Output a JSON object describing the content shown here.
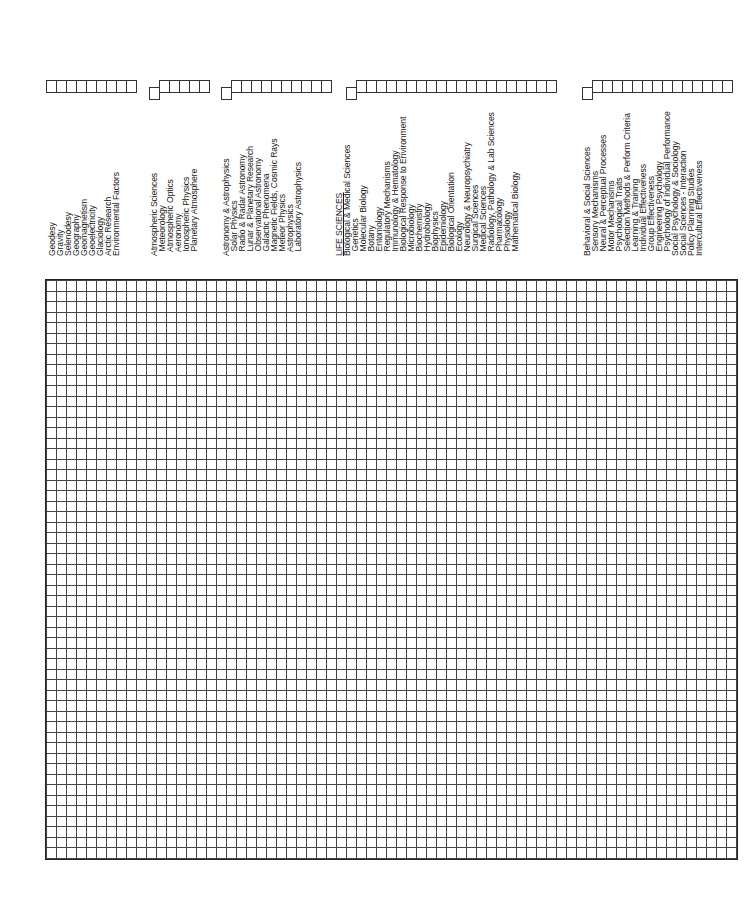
{
  "form": {
    "sections": [
      {
        "name": "earth-sciences",
        "box_x": 47,
        "boxes": 9,
        "offset_box": false
      },
      {
        "name": "atmospheric-sciences",
        "box_x": 150,
        "boxes": 5,
        "offset_box": true
      },
      {
        "name": "astronomy",
        "box_x": 222,
        "boxes": 10,
        "offset_box": true
      },
      {
        "name": "life-sciences",
        "box_x": 347,
        "boxes": 20,
        "offset_box": true
      },
      {
        "name": "behavioral-sciences",
        "box_x": 583,
        "boxes": 14,
        "offset_box": true
      }
    ],
    "columns": [
      {
        "x": 48,
        "label": "Geodesy"
      },
      {
        "x": 56,
        "label": "Gravity"
      },
      {
        "x": 64,
        "label": "Selenodesy"
      },
      {
        "x": 72,
        "label": "Geography"
      },
      {
        "x": 80,
        "label": "Geomagnetism"
      },
      {
        "x": 88,
        "label": "Geoelectricity"
      },
      {
        "x": 96,
        "label": "Glaciology"
      },
      {
        "x": 104,
        "label": "Arctic Research"
      },
      {
        "x": 112,
        "label": "Environmental Factors"
      },
      {
        "x": 150,
        "label": "Atmospheric Sciences"
      },
      {
        "x": 158,
        "label": "  Meteorology"
      },
      {
        "x": 166,
        "label": "  Atmospheric Optics"
      },
      {
        "x": 174,
        "label": "  Aeronomy"
      },
      {
        "x": 182,
        "label": "  Ionospheric Physics"
      },
      {
        "x": 190,
        "label": "  Planetary Atmosphere"
      },
      {
        "x": 222,
        "label": "Astronomy & Astrophysics"
      },
      {
        "x": 230,
        "label": "  Solar Physics"
      },
      {
        "x": 238,
        "label": "  Radio & Radar Astronomy"
      },
      {
        "x": 246,
        "label": "  Lunar & Planetary Research"
      },
      {
        "x": 254,
        "label": "  Observational Astronomy"
      },
      {
        "x": 262,
        "label": "  Galactic Phenomena"
      },
      {
        "x": 270,
        "label": "  Magnetic Fields, Cosmic Rays"
      },
      {
        "x": 278,
        "label": "  Meteor Physics"
      },
      {
        "x": 286,
        "label": "  Astrophysics"
      },
      {
        "x": 294,
        "label": "  Laboratory Astrophysics"
      },
      {
        "x": 335,
        "label": "LIFE SCIENCES",
        "underline": true
      },
      {
        "x": 343,
        "label": "Biological & Medical Sciences"
      },
      {
        "x": 351,
        "label": "  Genetics"
      },
      {
        "x": 359,
        "label": "  Molecular Biology"
      },
      {
        "x": 367,
        "label": "  Botany"
      },
      {
        "x": 375,
        "label": "  Entomology"
      },
      {
        "x": 383,
        "label": "  Regulatory Mechanisms"
      },
      {
        "x": 391,
        "label": "  Immunology & Hematology"
      },
      {
        "x": 399,
        "label": "  Biological Response to Environment"
      },
      {
        "x": 407,
        "label": "  Microbiology"
      },
      {
        "x": 415,
        "label": "  Biochemistry"
      },
      {
        "x": 423,
        "label": "  Hydrobiology"
      },
      {
        "x": 431,
        "label": "  Biophysics"
      },
      {
        "x": 439,
        "label": "  Epidemiology"
      },
      {
        "x": 447,
        "label": "  Biological Orientation"
      },
      {
        "x": 455,
        "label": "  Ecology"
      },
      {
        "x": 463,
        "label": "  Neurology & Neuropsychiatry"
      },
      {
        "x": 471,
        "label": "  Surgical Sciences"
      },
      {
        "x": 479,
        "label": "  Medical Sciences"
      },
      {
        "x": 487,
        "label": "  Radiology, Pathology & Lab Sciences"
      },
      {
        "x": 495,
        "label": "  Pharmacology"
      },
      {
        "x": 503,
        "label": "  Physiology"
      },
      {
        "x": 511,
        "label": "  Mathematical Biology"
      },
      {
        "x": 583,
        "label": "Behavioral & Social Sciences"
      },
      {
        "x": 591,
        "label": "  Sensory Mechanisms"
      },
      {
        "x": 599,
        "label": "  Neural & Perceptual Processes"
      },
      {
        "x": 607,
        "label": "  Motor Mechanisms"
      },
      {
        "x": 615,
        "label": "  Psychological Traits"
      },
      {
        "x": 623,
        "label": "  Selection Methods & Perform Criteria"
      },
      {
        "x": 631,
        "label": "  Learning & Training"
      },
      {
        "x": 639,
        "label": "  Individual Effectiveness"
      },
      {
        "x": 647,
        "label": "  Group Effectiveness"
      },
      {
        "x": 655,
        "label": "  Engineering Psychology"
      },
      {
        "x": 663,
        "label": "  Psychology of Individual Performance"
      },
      {
        "x": 671,
        "label": "Social Psychology & Sociology"
      },
      {
        "x": 679,
        "label": "Social Sciences - Interaction"
      },
      {
        "x": 687,
        "label": "Policy Planning Studies"
      },
      {
        "x": 695,
        "label": "Intercultural Effectiveness"
      }
    ],
    "grid": {
      "rows": 55,
      "cols": 69
    }
  }
}
